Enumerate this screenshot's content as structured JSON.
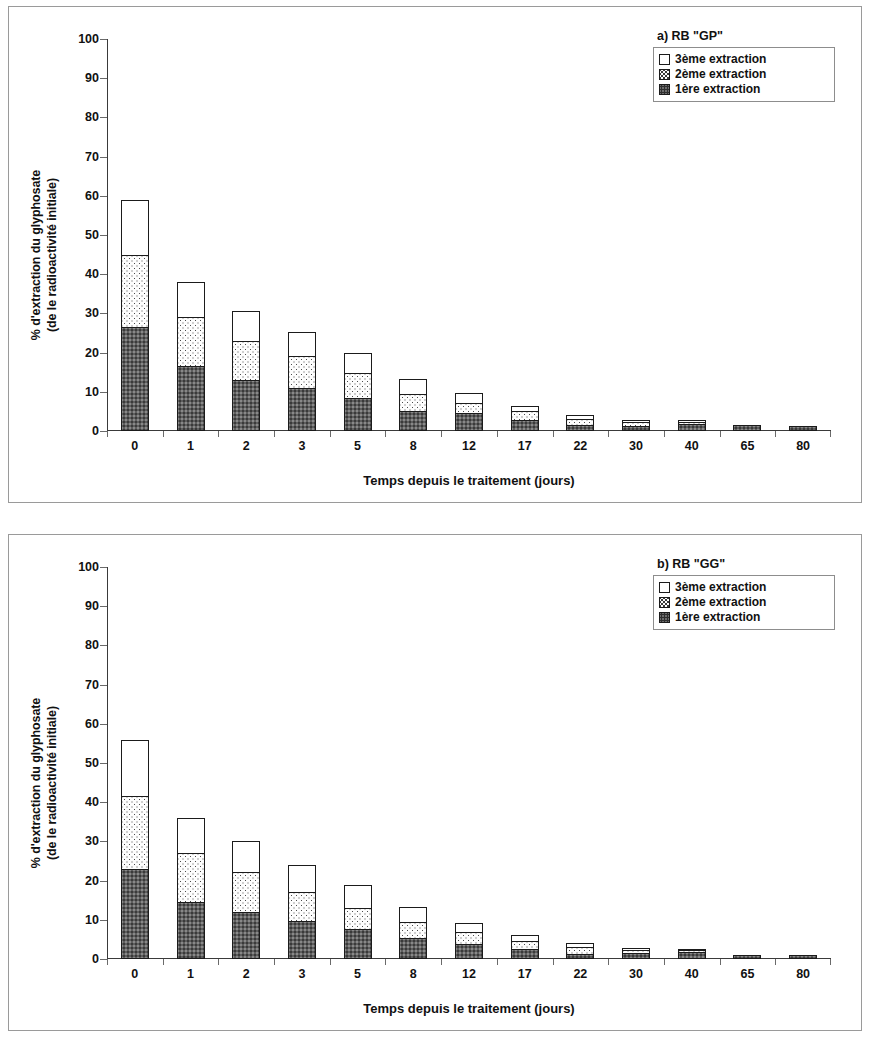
{
  "figure": {
    "y_axis_title_line1": "% d'extraction du glyphosate",
    "y_axis_title_line2": "(de le radioactivité initiale)",
    "x_axis_title": "Temps depuis le traitement (jours)"
  },
  "chart_data": [
    {
      "type": "bar",
      "stacked": true,
      "title": "a) RB \"GP\"",
      "xlabel": "Temps depuis le traitement (jours)",
      "ylabel": "% d'extraction du glyphosate (de le radioactivité initiale)",
      "ylim": [
        0,
        100
      ],
      "yticks": [
        0,
        10,
        20,
        30,
        40,
        50,
        60,
        70,
        80,
        90,
        100
      ],
      "grid": false,
      "legend_position": "top-right",
      "categories": [
        "0",
        "1",
        "2",
        "3",
        "5",
        "8",
        "12",
        "17",
        "22",
        "30",
        "40",
        "65",
        "80"
      ],
      "series": [
        {
          "name": "1ère  extraction",
          "fill": "dark-grey-stipple",
          "values": [
            26.5,
            16.5,
            13.0,
            11.0,
            8.5,
            5.2,
            4.5,
            2.7,
            1.6,
            1.3,
            1.9,
            1.5,
            1.4
          ]
        },
        {
          "name": "2ème extraction",
          "fill": "light-dotted",
          "values": [
            18.5,
            12.5,
            10.0,
            8.2,
            6.3,
            4.3,
            2.7,
            2.4,
            1.5,
            0.9,
            0.5,
            0.0,
            0.0
          ]
        },
        {
          "name": "3ème extraction",
          "fill": "white",
          "values": [
            14.0,
            9.0,
            7.7,
            6.1,
            5.0,
            3.7,
            2.5,
            1.3,
            1.1,
            0.6,
            0.3,
            0.0,
            0.0
          ]
        }
      ],
      "totals": [
        59.0,
        38.0,
        30.7,
        25.3,
        19.8,
        13.2,
        9.7,
        6.4,
        4.2,
        2.8,
        2.7,
        1.5,
        1.4
      ]
    },
    {
      "type": "bar",
      "stacked": true,
      "title": "b) RB \"GG\"",
      "xlabel": "Temps depuis le traitement (jours)",
      "ylabel": "% d'extraction du glyphosate (de le radioactivité initiale)",
      "ylim": [
        0,
        100
      ],
      "yticks": [
        0,
        10,
        20,
        30,
        40,
        50,
        60,
        70,
        80,
        90,
        100
      ],
      "grid": false,
      "legend_position": "top-right",
      "categories": [
        "0",
        "1",
        "2",
        "3",
        "5",
        "8",
        "12",
        "17",
        "22",
        "30",
        "40",
        "65",
        "80"
      ],
      "series": [
        {
          "name": "1ère  extraction",
          "fill": "dark-grey-stipple",
          "values": [
            23.0,
            14.5,
            12.0,
            9.8,
            7.6,
            5.4,
            3.9,
            2.6,
            1.4,
            1.5,
            1.8,
            1.1,
            1.0
          ]
        },
        {
          "name": "2ème extraction",
          "fill": "light-dotted",
          "values": [
            18.5,
            12.5,
            10.2,
            7.2,
            5.4,
            4.0,
            3.0,
            2.1,
            1.6,
            0.8,
            0.4,
            0.0,
            0.0
          ]
        },
        {
          "name": "3ème extraction",
          "fill": "white",
          "values": [
            14.5,
            9.0,
            7.8,
            6.9,
            6.0,
            4.0,
            2.2,
            1.5,
            1.2,
            0.5,
            0.2,
            0.0,
            0.0
          ]
        }
      ],
      "totals": [
        56.0,
        36.0,
        30.0,
        23.9,
        19.0,
        13.4,
        9.1,
        6.2,
        4.2,
        2.8,
        2.4,
        1.1,
        1.0
      ]
    }
  ],
  "legend": {
    "entries": [
      {
        "label": "3ème extraction",
        "key": "s3"
      },
      {
        "label": "2ème extraction",
        "key": "s2"
      },
      {
        "label": "1ère  extraction",
        "key": "s1"
      }
    ]
  }
}
